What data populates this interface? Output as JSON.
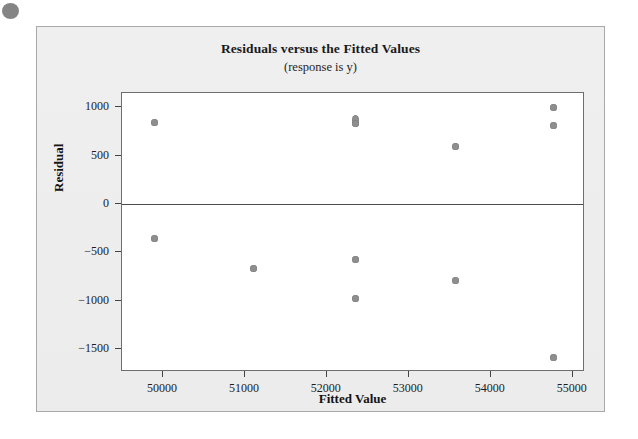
{
  "figure": {
    "background_color": "#eeeeee",
    "panel_color": "#ffffff",
    "frame_color": "#6e6e6e",
    "marker_color": "#8e8e8e",
    "artifact_dot_color": "#6f6f6f"
  },
  "chart_data": {
    "type": "scatter",
    "title": "Residuals versus the Fitted Values",
    "subtitle": "(response is y)",
    "xlabel": "Fitted Value",
    "ylabel": "Residual",
    "xlim": [
      49500,
      55150
    ],
    "ylim": [
      -1740,
      1150
    ],
    "xticks": [
      50000,
      51000,
      52000,
      53000,
      54000,
      55000
    ],
    "xtick_labels": [
      "50000",
      "51000",
      "52000",
      "53000",
      "54000",
      "55000"
    ],
    "yticks": [
      1000,
      500,
      0,
      -500,
      -1000,
      -1500
    ],
    "ytick_labels": [
      "1000",
      "500",
      "0",
      "−500",
      "−1000",
      "−1500"
    ],
    "grid": false,
    "legend": null,
    "reference_line": {
      "axis": "y",
      "value": 0
    },
    "points": [
      {
        "x": 49900,
        "y": 840,
        "overlap": false
      },
      {
        "x": 49900,
        "y": -355,
        "overlap": false
      },
      {
        "x": 51100,
        "y": -665,
        "overlap": false
      },
      {
        "x": 52350,
        "y": 870,
        "overlap": true
      },
      {
        "x": 52350,
        "y": 830,
        "overlap": false
      },
      {
        "x": 52350,
        "y": -570,
        "overlap": false
      },
      {
        "x": 52350,
        "y": -980,
        "overlap": false
      },
      {
        "x": 53570,
        "y": 600,
        "overlap": false
      },
      {
        "x": 53570,
        "y": -795,
        "overlap": false
      },
      {
        "x": 54760,
        "y": 995,
        "overlap": false
      },
      {
        "x": 54760,
        "y": 815,
        "overlap": false
      },
      {
        "x": 54760,
        "y": -1590,
        "overlap": false
      }
    ]
  }
}
